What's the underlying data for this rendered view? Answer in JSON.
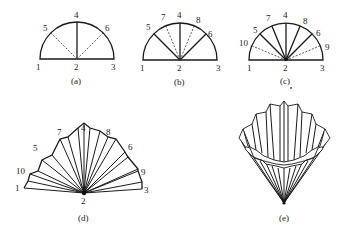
{
  "figure": {
    "panels": [
      {
        "id": "a",
        "caption": "(a)",
        "point_labels": [
          "1",
          "2",
          "3",
          "4",
          "5",
          "6"
        ]
      },
      {
        "id": "b",
        "caption": "(b)",
        "point_labels": [
          "1",
          "2",
          "3",
          "4",
          "5",
          "6",
          "7",
          "8"
        ]
      },
      {
        "id": "c",
        "caption": "(c)",
        "point_labels": [
          "1",
          "2",
          "3",
          "4",
          "5",
          "6",
          "7",
          "8",
          "9",
          "10"
        ]
      },
      {
        "id": "d",
        "caption": "(d)",
        "point_labels": [
          "1",
          "2",
          "3",
          "4",
          "5",
          "6",
          "7",
          "8",
          "9",
          "10"
        ]
      },
      {
        "id": "e",
        "caption": "(e)",
        "point_labels": []
      }
    ]
  }
}
